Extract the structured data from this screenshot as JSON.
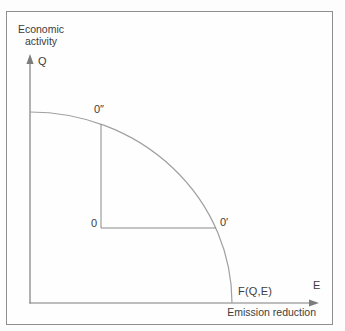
{
  "diagram": {
    "y_axis_title": "Economic activity",
    "y_axis_symbol": "Q",
    "x_axis_title": "Emission reduction",
    "x_axis_symbol": "E",
    "curve_label": "F(Q,E)",
    "point_origin_label": "0",
    "point_on_curve_horizontal_label": "0′",
    "point_on_curve_vertical_label": "0″"
  },
  "colors": {
    "frame_border": "#8f8f8f",
    "axis_line": "#7d7d7d",
    "curve_line": "#a0a0a0",
    "connector_line": "#8a8a8a",
    "text": "#3c3c3c",
    "background": "#fdfdfd"
  }
}
